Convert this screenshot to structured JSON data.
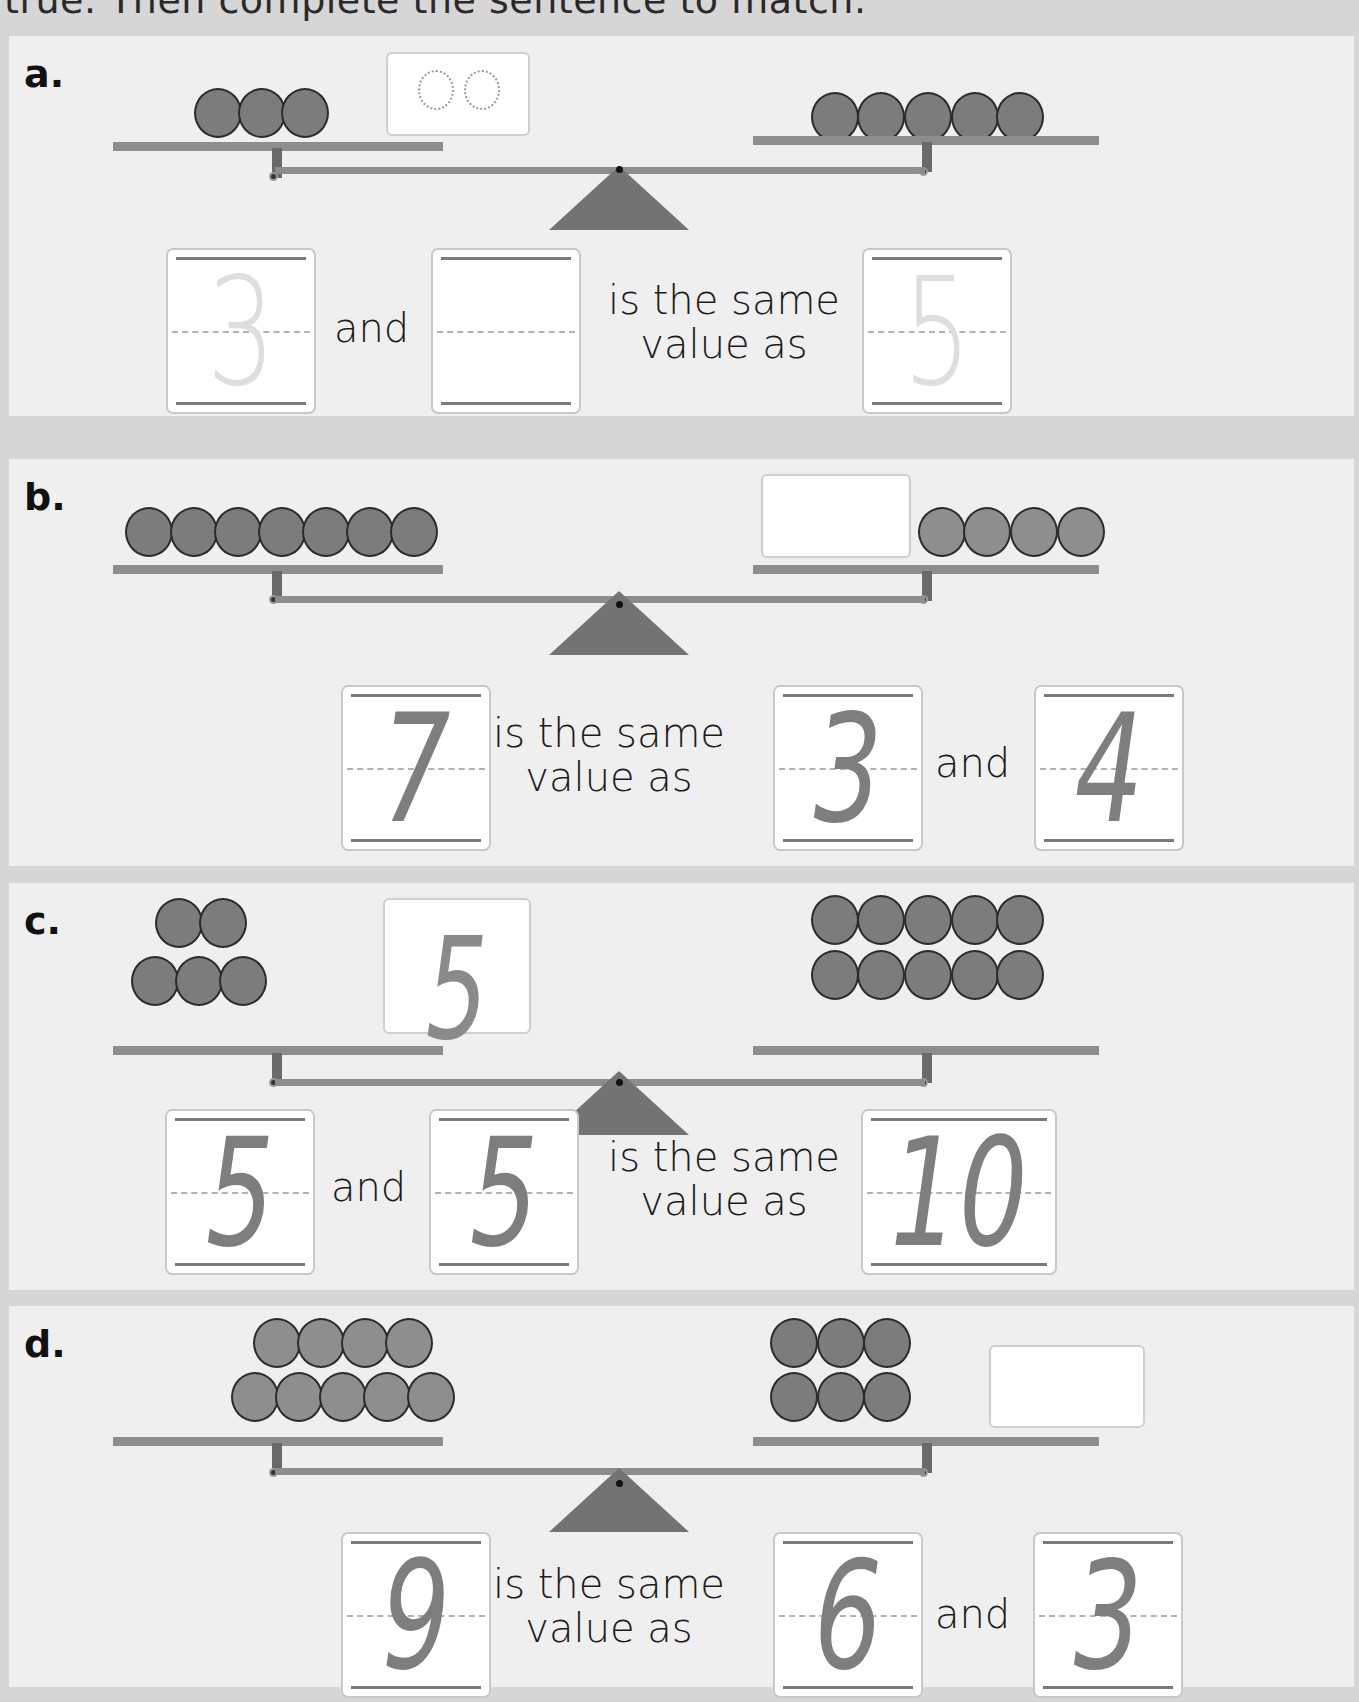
{
  "instruction": "true. Then complete the sentence to match.",
  "problems": [
    {
      "label": "a.",
      "left_counters": 3,
      "left_box": {
        "type": "dotted",
        "dotted_circles": 2,
        "value": ""
      },
      "right_counters": 5,
      "sentence": {
        "box1": "3",
        "word1": "and",
        "box2": "",
        "word2_line1": "is the same",
        "word2_line2": "value as",
        "box3": "5"
      }
    },
    {
      "label": "b.",
      "left_counters": 7,
      "right_box": {
        "value": ""
      },
      "right_counters": 4,
      "sentence": {
        "box1": "7",
        "word1_line1": "is the same",
        "word1_line2": "value as",
        "box2": "3",
        "word2": "and",
        "box3": "4"
      }
    },
    {
      "label": "c.",
      "left_counters": 5,
      "left_box": {
        "value": "5"
      },
      "right_counters": 10,
      "sentence": {
        "box1": "5",
        "word1": "and",
        "box2": "5",
        "word2_line1": "is the same",
        "word2_line2": "value as",
        "box3": "10"
      }
    },
    {
      "label": "d.",
      "left_counters": 9,
      "right_counters": 6,
      "right_box": {
        "value": ""
      },
      "sentence": {
        "box1": "9",
        "word1_line1": "is the same",
        "word1_line2": "value as",
        "box2": "6",
        "word2": "and",
        "box3": "3"
      }
    }
  ],
  "colors": {
    "page_bg": "#d6d6d6",
    "panel_bg": "#efefef",
    "counter_fill": "#7c7c7c",
    "beam": "#8d8d8d",
    "fulcrum": "#737373"
  }
}
